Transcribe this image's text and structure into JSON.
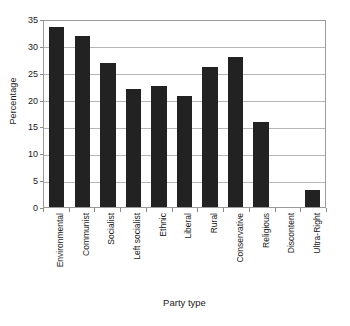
{
  "chart_data": {
    "type": "bar",
    "title": "",
    "subtitle": "",
    "xlabel": "Party type",
    "ylabel": "Percentage",
    "categories": [
      "Environmental",
      "Communist",
      "Socialist",
      "Left socialist",
      "Ethnic",
      "Liberal",
      "Rural",
      "Conservative",
      "Religious",
      "Discontent",
      "Ultra-Right"
    ],
    "values": [
      33.5,
      31.8,
      26.8,
      22.0,
      22.5,
      20.7,
      26.0,
      27.9,
      15.8,
      0,
      3.1
    ],
    "ylim": [
      0,
      35
    ],
    "yticks": [
      0,
      5,
      10,
      15,
      20,
      25,
      30,
      35
    ],
    "ytick_labels": [
      "0",
      "5",
      "10",
      "15",
      "20",
      "25",
      "30",
      "35"
    ],
    "grid": true,
    "grid_axis": "y",
    "legend": false,
    "legend_position": "none",
    "bar_color": "#222222",
    "gridline_color": "#b6b6b6",
    "frame_color": "#9a9a9a",
    "background_color": "#ffffff",
    "xtick_label_rotation": 90
  }
}
